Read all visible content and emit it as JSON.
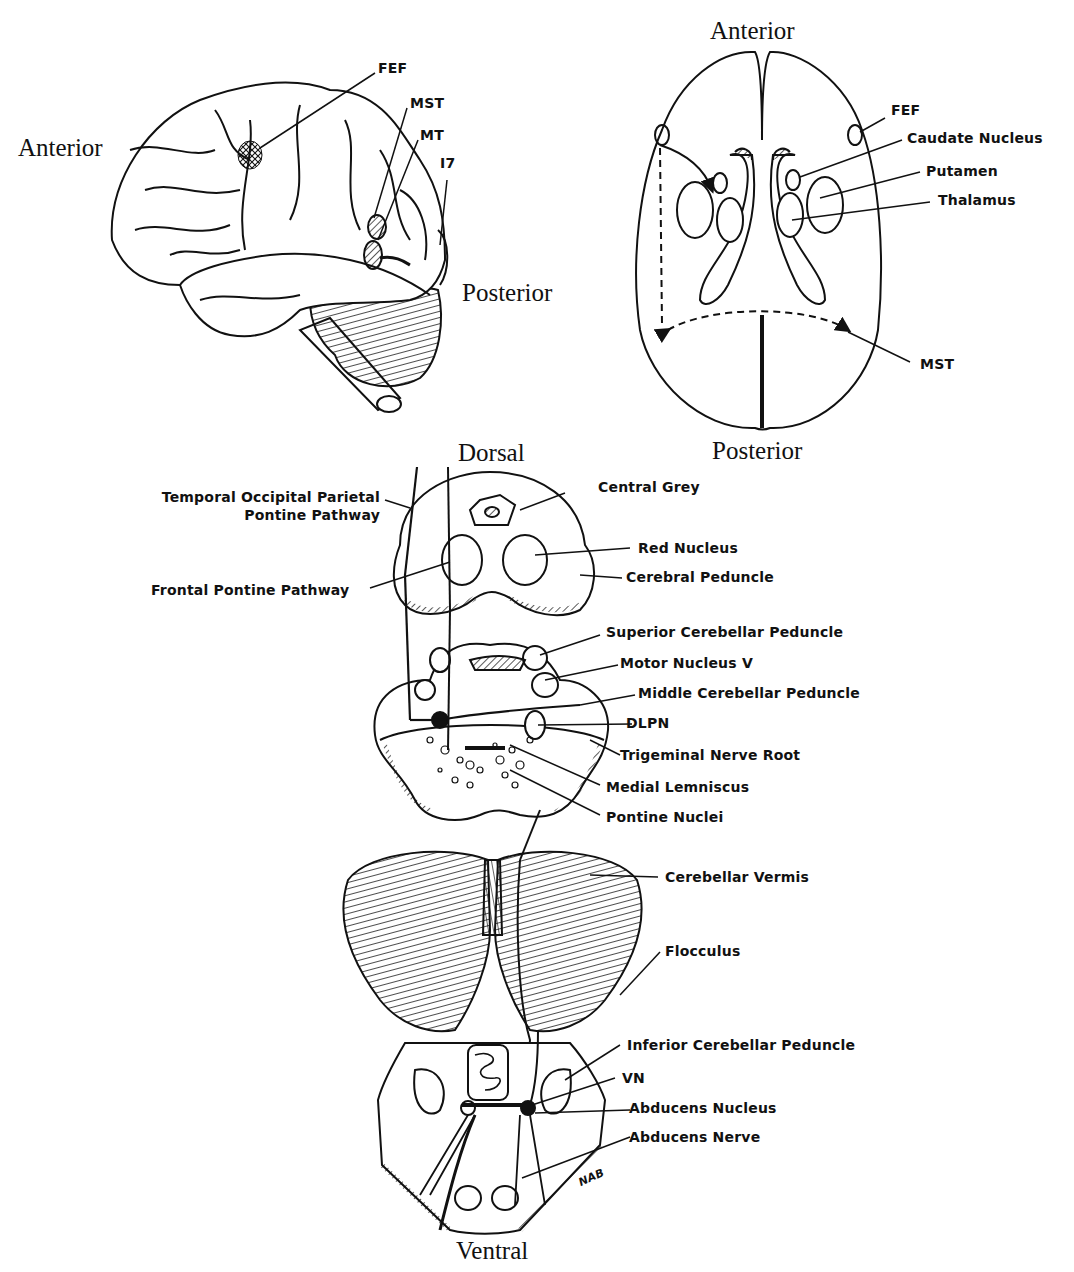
{
  "lateral_view": {
    "orientation": {
      "anterior": "Anterior",
      "posterior": "Posterior"
    },
    "labels": {
      "fef": "FEF",
      "mst": "MST",
      "mt": "MT",
      "area17": "I7"
    }
  },
  "axial_view": {
    "orientation": {
      "anterior": "Anterior",
      "posterior": "Posterior"
    },
    "labels": {
      "fef": "FEF",
      "caudate": "Caudate Nucleus",
      "putamen": "Putamen",
      "thalamus": "Thalamus",
      "mst": "MST"
    }
  },
  "brainstem_sections": {
    "orientation": {
      "dorsal": "Dorsal",
      "ventral": "Ventral"
    },
    "midbrain": {
      "temporal_line1": "Temporal Occipital Parietal",
      "temporal_line2": "Pontine Pathway",
      "frontal": "Frontal Pontine Pathway",
      "central_grey": "Central Grey",
      "red_nucleus": "Red Nucleus",
      "cerebral_peduncle": "Cerebral Peduncle"
    },
    "pons": {
      "superior_cp": "Superior Cerebellar Peduncle",
      "motor_v": "Motor Nucleus V",
      "middle_cp": "Middle Cerebellar Peduncle",
      "dlpn": "DLPN",
      "trigeminal": "Trigeminal Nerve Root",
      "medial_lemniscus": "Medial Lemniscus",
      "pontine_nuclei": "Pontine Nuclei"
    },
    "cerebellum": {
      "vermis": "Cerebellar Vermis",
      "flocculus": "Flocculus"
    },
    "medulla": {
      "inferior_cp": "Inferior Cerebellar Peduncle",
      "vn": "VN",
      "abducens_nucleus": "Abducens Nucleus",
      "abducens_nerve": "Abducens Nerve",
      "signature": "NAB"
    }
  }
}
